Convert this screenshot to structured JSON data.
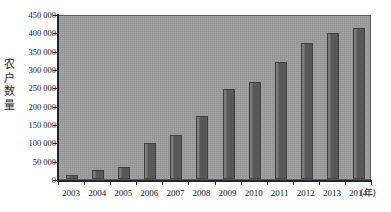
{
  "chart_data": {
    "type": "bar",
    "title": "",
    "subtitle": "",
    "xlabel": "年",
    "ylabel": "农户数量",
    "x_unit_label": "(年)",
    "categories": [
      "2003",
      "2004",
      "2005",
      "2006",
      "2007",
      "2008",
      "2009",
      "2010",
      "2011",
      "2012",
      "2013",
      "2014"
    ],
    "values": [
      10000,
      25000,
      32000,
      98000,
      120000,
      172000,
      245000,
      265000,
      318000,
      370000,
      398000,
      412000
    ],
    "series": [
      {
        "name": "农户数量",
        "values": [
          10000,
          25000,
          32000,
          98000,
          120000,
          172000,
          245000,
          265000,
          318000,
          370000,
          398000,
          412000
        ]
      }
    ],
    "ylim": [
      0,
      450000
    ],
    "y_ticks": [
      0,
      50000,
      100000,
      150000,
      200000,
      250000,
      300000,
      350000,
      400000,
      450000
    ],
    "y_tick_labels": [
      "0",
      "50 000",
      "100 000",
      "150 000",
      "200 000",
      "250 000",
      "300 000",
      "350 000",
      "400 000",
      "450 000"
    ],
    "grid": false,
    "legend": null,
    "legend_position": "none",
    "plot_background_color": "#9d9d9d",
    "bar_color": "#5e5e5e",
    "bar_edge_color": "#3f3f3f",
    "axis_color": "#23252a",
    "text_color": "#17181a"
  }
}
